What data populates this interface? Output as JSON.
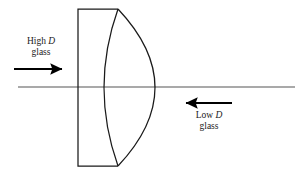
{
  "figure": {
    "kind": "optical-lens-cross-section-diagram",
    "background_color": "#ffffff",
    "stroke_color": "#1a1a1a",
    "axis_color": "#555555"
  },
  "labels": {
    "high_d": {
      "line1_text": "High ",
      "line1_symbol": "D",
      "line2_text": "glass"
    },
    "low_d": {
      "line1_text": "Low ",
      "line1_symbol": "D",
      "line2_text": "glass"
    }
  },
  "arrows": {
    "incoming_ray": {
      "direction": "right",
      "x1": 14,
      "y1": 69,
      "x2": 67,
      "y2": 69
    },
    "outgoing_ray": {
      "direction": "left",
      "x1": 232,
      "y1": 103,
      "x2": 181,
      "y2": 103
    }
  },
  "optical_axis": {
    "x1": 18,
    "y1": 87,
    "x2": 295,
    "y2": 87
  },
  "lens_geometry": {
    "flat_element": {
      "left_x": 78,
      "right_x": 118,
      "top_y": 9,
      "bottom_y": 166
    },
    "inner_concave_arc": {
      "start": [
        118,
        9
      ],
      "apex_x": 101,
      "end": [
        118,
        166
      ]
    },
    "outer_convex_arc": {
      "start": [
        118,
        9
      ],
      "apex_x": 163,
      "end": [
        118,
        166
      ]
    }
  }
}
